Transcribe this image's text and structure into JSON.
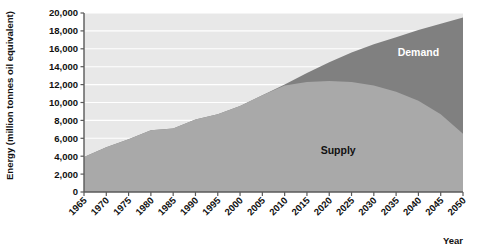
{
  "chart_data": {
    "type": "area",
    "title": "",
    "xlabel": "Year",
    "ylabel": "Energy (million tonnes oil equivalent)",
    "xlim": [
      1965,
      2050
    ],
    "ylim": [
      0,
      20000
    ],
    "grid": true,
    "legend_position": "inline-labels",
    "x": [
      1965,
      1970,
      1975,
      1980,
      1985,
      1990,
      1995,
      2000,
      2005,
      2010,
      2015,
      2020,
      2025,
      2030,
      2035,
      2040,
      2045,
      2050
    ],
    "xticklabels": [
      "1965",
      "1970",
      "1975",
      "1980",
      "1985",
      "1990",
      "1995",
      "2000",
      "2005",
      "2010",
      "2015",
      "2020",
      "2025",
      "2030",
      "2035",
      "2040",
      "2045",
      "2050"
    ],
    "yticks": [
      0,
      2000,
      4000,
      6000,
      8000,
      10000,
      12000,
      14000,
      16000,
      18000,
      20000
    ],
    "yticklabels": [
      "0",
      "2,000",
      "4,000",
      "6,000",
      "8,000",
      "10,000",
      "12,000",
      "14,000",
      "16,000",
      "18,000",
      "20,000"
    ],
    "series": [
      {
        "name": "Demand",
        "color": "#808080",
        "label_text": "Demand",
        "values": [
          3900,
          5000,
          5900,
          6900,
          7100,
          8100,
          8700,
          9600,
          10800,
          12000,
          13300,
          14500,
          15600,
          16500,
          17300,
          18100,
          18800,
          19500
        ]
      },
      {
        "name": "Supply",
        "color": "#a9a9a9",
        "label_text": "Supply",
        "values": [
          3900,
          5000,
          5900,
          6900,
          7100,
          8100,
          8700,
          9600,
          10800,
          11900,
          12300,
          12400,
          12300,
          11900,
          11200,
          10200,
          8700,
          6500
        ]
      }
    ],
    "annotations": [
      {
        "text": "Supply",
        "x_value": 2022,
        "y_value": 4200
      },
      {
        "text": "Demand",
        "x_value": 2040,
        "y_value": 15200
      }
    ],
    "colors": {
      "plot_background": "#e8e8e8",
      "gridline": "#ffffff",
      "axis": "#5a5a5a",
      "page_background": "#ffffff",
      "supply_fill": "#a9a9a9",
      "demand_fill": "#808080",
      "text": "#111111"
    }
  }
}
